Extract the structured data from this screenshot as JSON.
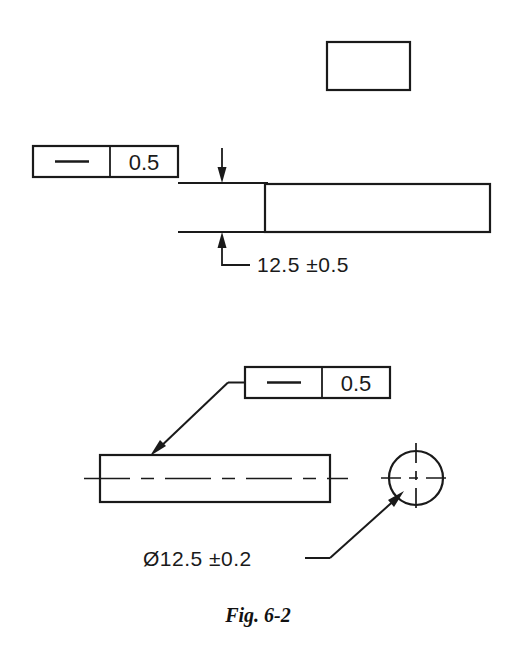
{
  "figure": {
    "caption": "Fig. 6-2",
    "background_color": "#ffffff",
    "line_color": "#1a1a1a"
  },
  "top_view": {
    "name": "flat-bar-side-view",
    "blank_rect_label": "",
    "feature_control_frame": {
      "symbol_name": "straightness-symbol",
      "symbol_glyph": "—",
      "tolerance": "0.5"
    },
    "dimension": {
      "nominal": "12.5",
      "tolerance": "±0.5",
      "full_text": "12.5  ±0.5"
    }
  },
  "bottom_view": {
    "name": "cylinder-view",
    "feature_control_frame": {
      "symbol_name": "straightness-symbol",
      "symbol_glyph": "—",
      "tolerance": "0.5"
    },
    "dimension": {
      "diameter_symbol": "Ø",
      "nominal": "12.5",
      "tolerance": "±0.2",
      "full_text": "Ø12.5  ±0.2"
    }
  }
}
